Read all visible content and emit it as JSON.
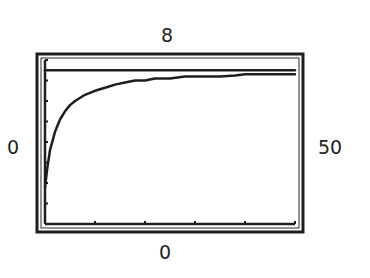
{
  "window": {
    "ymax_label": "8",
    "xmin_label": "0",
    "xmax_label": "50",
    "ymin_label": "0"
  },
  "chart_data": {
    "type": "line",
    "title": "",
    "xlabel": "",
    "ylabel": "",
    "xlim": [
      0,
      50
    ],
    "ylim": [
      0,
      8
    ],
    "grid": false,
    "legend": null,
    "x_ticks": [
      0,
      10,
      20,
      30,
      40,
      50
    ],
    "y_ticks": [
      0,
      1,
      2,
      3,
      4,
      5,
      6,
      7,
      8
    ],
    "annotations": [
      {
        "text": "8",
        "position": "top",
        "meaning": "Ymax"
      },
      {
        "text": "0",
        "position": "left",
        "meaning": "Xmin"
      },
      {
        "text": "50",
        "position": "right",
        "meaning": "Xmax"
      },
      {
        "text": "0",
        "position": "bottom",
        "meaning": "Ymin"
      }
    ],
    "series": [
      {
        "name": "asymptote",
        "style": "horizontal line",
        "x": [
          0,
          50
        ],
        "y": [
          7.5,
          7.5
        ]
      },
      {
        "name": "curve",
        "style": "step-like increasing curve",
        "x": [
          0,
          0.5,
          1,
          2,
          3,
          4,
          5,
          6,
          8,
          10,
          12,
          14,
          16,
          18,
          20,
          22,
          25,
          28,
          30,
          33,
          35,
          38,
          40,
          45,
          50
        ],
        "y": [
          1.8,
          2.8,
          3.6,
          4.5,
          5.1,
          5.5,
          5.8,
          6.0,
          6.3,
          6.5,
          6.65,
          6.8,
          6.9,
          7.0,
          7.0,
          7.1,
          7.1,
          7.2,
          7.2,
          7.2,
          7.2,
          7.25,
          7.3,
          7.3,
          7.3
        ]
      }
    ]
  }
}
